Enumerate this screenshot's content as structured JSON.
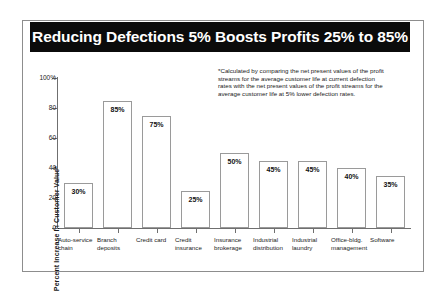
{
  "chart_data": {
    "type": "bar",
    "title": "Reducing Defections 5% Boosts Profits 25% to 85%",
    "xlabel": "",
    "ylabel": "Percent Increase In Customer Value*",
    "ylim": [
      0,
      100
    ],
    "grid": false,
    "legend": "none",
    "categories": [
      "Auto-service chain",
      "Branch deposits",
      "Credit card",
      "Credit insurance",
      "Insurance brokerage",
      "Industrial distribution",
      "Industrial laundry",
      "Office-bldg. management",
      "Software"
    ],
    "values": [
      30,
      85,
      75,
      25,
      50,
      45,
      45,
      40,
      35
    ],
    "value_labels": [
      "30%",
      "85%",
      "75%",
      "25%",
      "50%",
      "45%",
      "45%",
      "40%",
      "35%"
    ],
    "ytick_values": [
      0,
      20,
      40,
      60,
      80,
      100
    ],
    "ytick_labels": [
      "0",
      "20",
      "40",
      "60",
      "80",
      "100%"
    ],
    "annotation": "*Calculated by comparing the net present values of the profit streams for the average customer life at current defection rates with the net present values of the profit streams for the average customer life at 5% lower defection rates.",
    "colors": {
      "title_bar_background": "#0b0b0b",
      "title_text": "#ffffff",
      "bar_fill": "#ffffff",
      "bar_outline": "#9a9a9a",
      "axis": "#6f6f6f",
      "frame": "#8d8d8d",
      "text": "#1a1a1a"
    }
  },
  "categories_wrapped": [
    "Auto-service chain",
    "Branch deposits",
    "Credit card",
    "Credit insurance",
    "Insurance brokerage",
    "Industrial distribution",
    "Industrial laundry",
    "Office-bldg. management",
    "Software"
  ]
}
